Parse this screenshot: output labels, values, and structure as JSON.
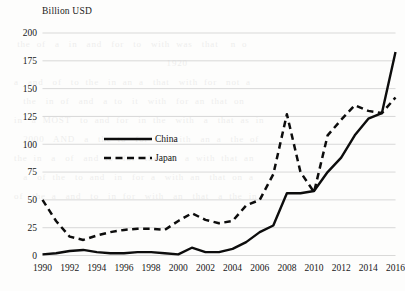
{
  "chart_data": {
    "type": "line",
    "title": "",
    "ylabel": "Billion USD",
    "xlabel": "",
    "ylim": [
      0,
      200
    ],
    "yticks": [
      0,
      25,
      50,
      75,
      100,
      125,
      150,
      175,
      200
    ],
    "xticks": [
      1990,
      1992,
      1994,
      1996,
      1998,
      2000,
      2002,
      2004,
      2006,
      2008,
      2010,
      2012,
      2014,
      2016
    ],
    "x": [
      1990,
      1991,
      1992,
      1993,
      1994,
      1995,
      1996,
      1997,
      1998,
      1999,
      2000,
      2001,
      2002,
      2003,
      2004,
      2005,
      2006,
      2007,
      2008,
      2009,
      2010,
      2011,
      2012,
      2013,
      2014,
      2015,
      2016
    ],
    "grid": "horizontal",
    "legend_position": "inside-upper-left",
    "series": [
      {
        "name": "China",
        "style": "solid",
        "color": "#0d0d0d",
        "values": [
          1,
          2,
          4,
          5,
          3,
          2,
          2,
          3,
          3,
          2,
          1,
          7,
          3,
          3,
          6,
          12,
          21,
          27,
          56,
          56,
          58,
          75,
          88,
          108,
          123,
          128,
          183
        ]
      },
      {
        "name": "Japan",
        "style": "dashed",
        "color": "#0d0d0d",
        "values": [
          50,
          31,
          17,
          14,
          18,
          21,
          23,
          24,
          24,
          23,
          31,
          38,
          32,
          29,
          31,
          45,
          50,
          73,
          127,
          75,
          57,
          108,
          122,
          135,
          130,
          128,
          142
        ]
      }
    ],
    "legend": [
      {
        "label": "China",
        "style": "solid"
      },
      {
        "label": "Japan",
        "style": "dashed"
      }
    ]
  },
  "background_text": "\n   the  of   a   in   and   for   to   with  was   that    n  o\n                                                    1920\n  a   and   of   to  the   in  an  a   that   with  for   not  a\n     the   in  of   and   a  to   it   with   for  an  that  on\n  in   a  MOST   to  and  for   in  the   with   a   that  as  in\n     2000   AND   a   the  to   for  in   with   an  a   the  of\n  the  in   a   of   and  to   for   the   in   a  with  that  an\n     a   of  the   to  and   in   for  a   with  an   that  on  a\n  of   the  a   and   to   in  for   with   an   that   a  the  in"
}
